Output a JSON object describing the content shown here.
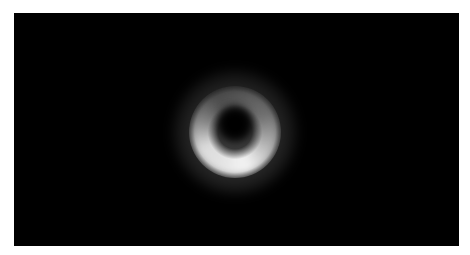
{
  "image": {
    "subject": "black hole shadow ring",
    "background_color": "#000000",
    "border_color": "#ffffff",
    "ring_color": "#f0f0f0",
    "description": "Blurred grayscale ring of light around a dark center, brighter along the lower-left arc"
  }
}
